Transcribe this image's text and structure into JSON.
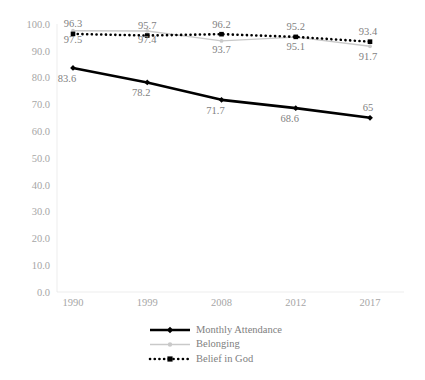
{
  "chart_data": {
    "type": "line",
    "title": "",
    "xlabel": "",
    "ylabel": "",
    "categories": [
      "1990",
      "1999",
      "2008",
      "2012",
      "2017"
    ],
    "ylim": [
      0,
      100
    ],
    "ytick_labels": [
      "100.0",
      "90.0",
      "80.0",
      "70.0",
      "60.0",
      "50.0",
      "40.0",
      "30.0",
      "20.0",
      "10.0",
      "0.0"
    ],
    "ytick_values": [
      100,
      90,
      80,
      70,
      60,
      50,
      40,
      30,
      20,
      10,
      0
    ],
    "grid": false,
    "legend_position": "bottom",
    "series": [
      {
        "name": "Monthly Attendance",
        "style": "solid-thick",
        "color": "#000000",
        "marker": "diamond",
        "values": [
          83.6,
          78.2,
          71.7,
          68.6,
          65
        ],
        "labels": [
          "83.6",
          "78.2",
          "71.7",
          "68.6",
          "65"
        ],
        "label_position": "below"
      },
      {
        "name": "Belonging",
        "style": "solid-thin",
        "color": "#c9c9c9",
        "marker": "dot",
        "values": [
          97.5,
          97.4,
          93.7,
          95.1,
          91.7
        ],
        "labels": [
          "97.5",
          "97.4",
          "93.7",
          "95.1",
          "91.7"
        ],
        "label_position": "below"
      },
      {
        "name": "Belief in God",
        "style": "dotted",
        "color": "#000000",
        "marker": "square",
        "values": [
          96.3,
          95.7,
          96.2,
          95.2,
          93.4
        ],
        "labels": [
          "96.3",
          "95.7",
          "96.2",
          "95.2",
          "93.4"
        ],
        "label_position": "above"
      }
    ]
  },
  "legend": {
    "items": [
      {
        "label": "Monthly Attendance"
      },
      {
        "label": "Belonging"
      },
      {
        "label": "Belief in God"
      }
    ]
  }
}
